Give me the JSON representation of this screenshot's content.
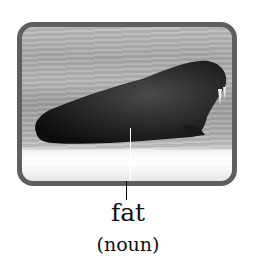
{
  "card": {
    "image_subject": "walrus on ice",
    "word": "fat",
    "part_of_speech": "(noun)",
    "frame_color": "#5f5f5f"
  }
}
